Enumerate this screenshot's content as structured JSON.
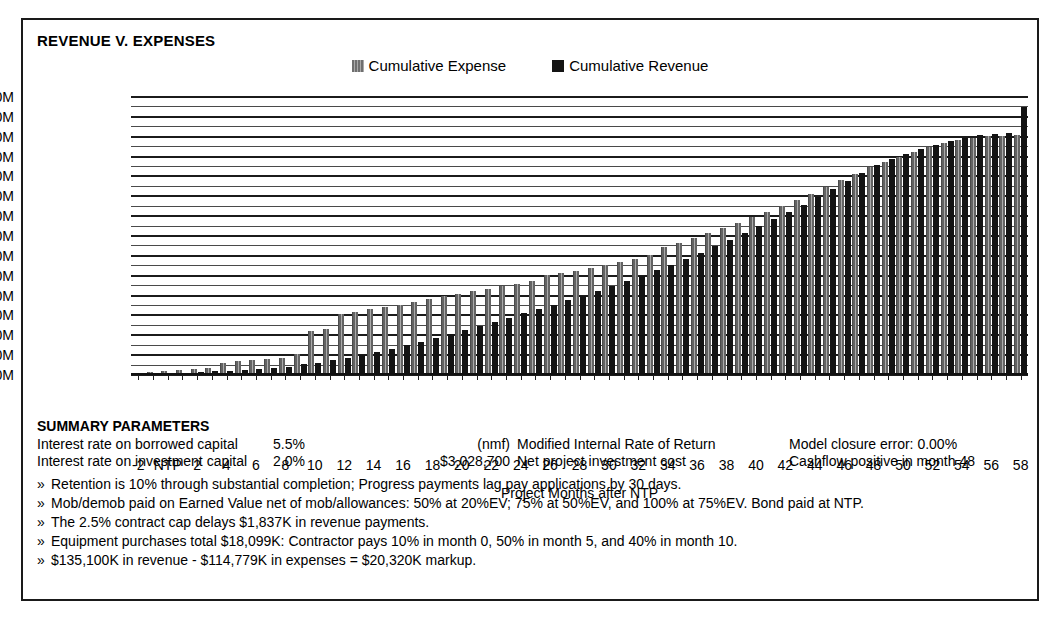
{
  "chart_title": "REVENUE V. EXPENSES",
  "legend": {
    "position": "top-center",
    "items": [
      {
        "label": "Cumulative Expense",
        "swatch": "expense-swatch-icon",
        "color": "#777777"
      },
      {
        "label": "Cumulative Revenue",
        "swatch": "revenue-swatch-icon",
        "color": "#131313"
      }
    ]
  },
  "chart_data": {
    "type": "bar",
    "title": "REVENUE V. EXPENSES",
    "xlabel": "Project Months after NTP",
    "ylabel": "",
    "ylim": [
      0,
      140
    ],
    "yunit": "M",
    "ytick_labels": [
      "$0.0M",
      "$10.0M",
      "$20.0M",
      "$30.0M",
      "$40.0M",
      "$50.0M",
      "$60.0M",
      "$70.0M",
      "$80.0M",
      "$90.0M",
      "$100.0M",
      "$110.0M",
      "$120.0M",
      "$130.0M",
      "$140.0M"
    ],
    "ytick_values": [
      0,
      10,
      20,
      30,
      40,
      50,
      60,
      70,
      80,
      90,
      100,
      110,
      120,
      130,
      140
    ],
    "grid": true,
    "grid_minor_step": 5,
    "categories": [
      -2,
      -1,
      0,
      1,
      2,
      3,
      4,
      5,
      6,
      7,
      8,
      9,
      10,
      11,
      12,
      13,
      14,
      15,
      16,
      17,
      18,
      19,
      20,
      21,
      22,
      23,
      24,
      25,
      26,
      27,
      28,
      29,
      30,
      31,
      32,
      33,
      34,
      35,
      36,
      37,
      38,
      39,
      40,
      41,
      42,
      43,
      44,
      45,
      46,
      47,
      48,
      49,
      50,
      51,
      52,
      53,
      54,
      55,
      56,
      57,
      58
    ],
    "xtick_labels": [
      "-2",
      "",
      "NTP",
      "",
      "2",
      "",
      "4",
      "",
      "6",
      "",
      "8",
      "",
      "10",
      "",
      "12",
      "",
      "14",
      "",
      "16",
      "",
      "18",
      "",
      "20",
      "",
      "22",
      "",
      "24",
      "",
      "26",
      "",
      "28",
      "",
      "30",
      "",
      "32",
      "",
      "34",
      "",
      "36",
      "",
      "38",
      "",
      "40",
      "",
      "42",
      "",
      "44",
      "",
      "46",
      "",
      "48",
      "",
      "50",
      "",
      "52",
      "",
      "54",
      "",
      "56",
      "",
      "58"
    ],
    "series": [
      {
        "name": "Cumulative Expense",
        "color": "#777777",
        "values": [
          1.2,
          1.5,
          2.2,
          2.6,
          3.0,
          3.4,
          6.2,
          7.0,
          7.6,
          8.2,
          8.8,
          10.6,
          22.2,
          23.4,
          30.6,
          31.8,
          33.0,
          34.2,
          35.4,
          36.6,
          38.4,
          39.6,
          41.0,
          42.2,
          43.5,
          44.7,
          46.0,
          47.2,
          50.2,
          51.4,
          52.6,
          54.0,
          55.4,
          57.0,
          58.6,
          60.4,
          64.4,
          66.6,
          69.0,
          71.4,
          74.0,
          76.6,
          79.4,
          82.2,
          85.2,
          88.2,
          91.4,
          94.6,
          98.0,
          101.2,
          104.6,
          107.4,
          110.0,
          112.4,
          114.6,
          116.6,
          118.2,
          119.4,
          120.2,
          120.6,
          120.8
        ]
      },
      {
        "name": "Cumulative Revenue",
        "color": "#131313",
        "values": [
          0.0,
          0.2,
          1.0,
          1.2,
          1.5,
          1.8,
          2.2,
          2.6,
          3.0,
          3.4,
          3.8,
          5.4,
          6.2,
          7.4,
          8.6,
          10.0,
          11.6,
          13.2,
          15.0,
          16.8,
          18.8,
          20.8,
          22.8,
          24.8,
          26.8,
          28.8,
          31.0,
          33.2,
          35.4,
          37.6,
          40.0,
          42.4,
          44.8,
          47.4,
          50.0,
          52.8,
          55.6,
          58.6,
          61.6,
          64.8,
          68.0,
          71.4,
          74.8,
          78.4,
          82.0,
          85.8,
          89.6,
          93.6,
          97.6,
          101.8,
          106.0,
          108.8,
          111.4,
          113.8,
          116.0,
          118.0,
          119.6,
          120.8,
          121.6,
          122.0,
          135.1
        ]
      }
    ]
  },
  "summary": {
    "heading": "SUMMARY PARAMETERS",
    "rows": [
      {
        "label": "Interest rate on borrowed capital",
        "value": "5.5%",
        "amount": "(nmf)",
        "desc": "Modified Internal Rate of Return",
        "note": "Model closure error: 0.00%"
      },
      {
        "label": "Interest rate on investment capital",
        "value": "2.0%",
        "amount": "$3,028,700",
        "desc": "Net project investment cost",
        "note": "Cashflow positive in month 48"
      }
    ],
    "bullet": "»",
    "notes": [
      "Retention is 10% through substantial completion; Progress payments lag pay applications by 30 days.",
      "Mob/demob paid on Earned Value net of mob/allowances: 50% at 20%EV; 75% at 50%EV, and 100% at 75%EV.  Bond paid at NTP.",
      "The 2.5% contract cap delays $1,837K in revenue payments.",
      "Equipment purchases total $18,099K: Contractor pays 10% in month 0, 50% in month 5, and 40% in month 10.",
      "$135,100K in revenue - $114,779K in expenses = $20,320K markup."
    ]
  }
}
